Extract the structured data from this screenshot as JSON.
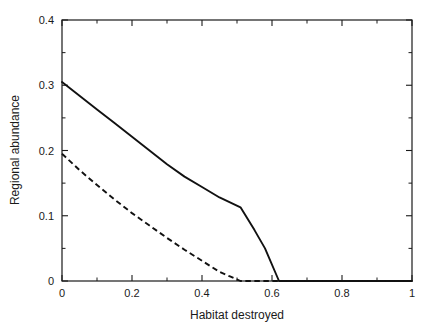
{
  "chart_data": {
    "type": "line",
    "title": "",
    "subtitle": "",
    "xlabel": "Habitat destroyed",
    "ylabel": "Regional abundance",
    "xlim": [
      0,
      1
    ],
    "ylim": [
      0,
      0.4
    ],
    "grid": false,
    "legend": "none",
    "x_ticks_major": [
      0,
      0.2,
      0.4,
      0.6,
      0.8,
      1
    ],
    "x_tick_labels": [
      "0",
      "0.2",
      "0.4",
      "0.6",
      "0.8",
      "1"
    ],
    "x_ticks_minor": [
      0.1,
      0.3,
      0.5,
      0.7,
      0.9
    ],
    "y_ticks_major": [
      0,
      0.1,
      0.2,
      0.3,
      0.4
    ],
    "y_tick_labels": [
      "0",
      "0.1",
      "0.2",
      "0.3",
      "0.4"
    ],
    "y_ticks_minor": [
      0.05,
      0.15,
      0.25,
      0.35
    ],
    "series": [
      {
        "name": "superior competitor (solid)",
        "style": "solid",
        "color": "#111111",
        "x": [
          0.0,
          0.05,
          0.1,
          0.15,
          0.2,
          0.25,
          0.3,
          0.35,
          0.4,
          0.45,
          0.51,
          0.55,
          0.58,
          0.62,
          1.0
        ],
        "values": [
          0.305,
          0.284,
          0.263,
          0.242,
          0.221,
          0.2,
          0.179,
          0.16,
          0.144,
          0.128,
          0.113,
          0.078,
          0.05,
          0.0,
          0.0
        ]
      },
      {
        "name": "inferior competitor (dashed)",
        "style": "dashed",
        "color": "#111111",
        "x": [
          0.0,
          0.05,
          0.1,
          0.15,
          0.2,
          0.25,
          0.3,
          0.35,
          0.4,
          0.45,
          0.48,
          0.51,
          1.0
        ],
        "values": [
          0.195,
          0.17,
          0.147,
          0.125,
          0.104,
          0.085,
          0.066,
          0.048,
          0.031,
          0.014,
          0.007,
          0.0,
          0.0
        ]
      }
    ],
    "annotations": []
  },
  "axes": {
    "y_axis_title": "Regional abundance",
    "x_axis_title": "Habitat destroyed"
  }
}
